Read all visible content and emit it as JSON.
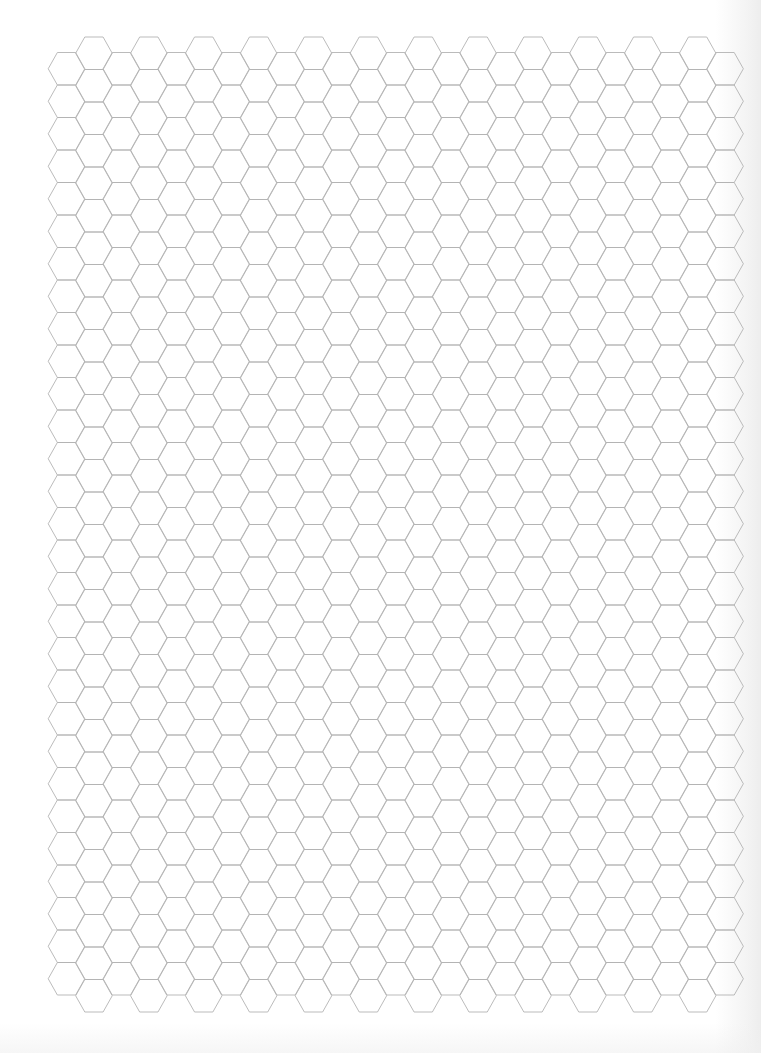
{
  "document": {
    "type": "hexagonal graph paper",
    "page": {
      "width": 761,
      "height": 1053,
      "background": "#ffffff"
    }
  },
  "grid": {
    "orientation": "flat-top",
    "columns": 25,
    "first_column_center_x": 66.5,
    "column_spacing": 27.44,
    "hex_half_width": 18.29,
    "hex_height": 32.5,
    "even_columns": {
      "top_y": 52.5,
      "hex_count": 29
    },
    "odd_columns": {
      "top_y": 37,
      "hex_count": 30
    },
    "line_color": "#b3b3b3"
  }
}
